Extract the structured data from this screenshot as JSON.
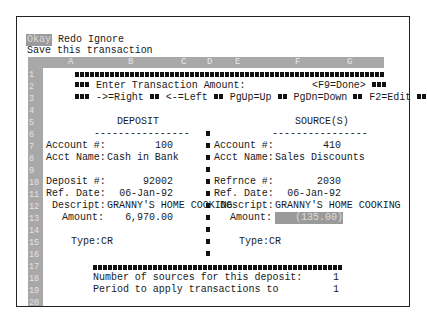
{
  "menu": {
    "items": [
      {
        "label": "Okay",
        "selected": true
      },
      {
        "label": "Redo",
        "selected": false
      },
      {
        "label": "Ignore",
        "selected": false
      }
    ],
    "status": "Save this transaction"
  },
  "grid": {
    "columns": [
      "A",
      "B",
      "C",
      "D",
      "E",
      "F",
      "G"
    ],
    "rows": [
      "1",
      "2",
      "3",
      "4",
      "5",
      "6",
      "7",
      "8",
      "9",
      "10",
      "11",
      "12",
      "13",
      "14",
      "15",
      "16",
      "17",
      "18",
      "19",
      "20"
    ]
  },
  "banner": {
    "prompt": "Enter Transaction Amount:",
    "done_key": "<F9=Done>",
    "keys": [
      "->=Right",
      "<-=Left",
      "PgUp=Up",
      "PgDn=Down",
      "F2=Edit"
    ]
  },
  "deposit": {
    "title": "DEPOSIT",
    "underline": "----------------",
    "account_label": "Account #:",
    "account_value": "100",
    "acct_name_label": "Acct Name:",
    "acct_name_value": "Cash in Bank",
    "deposit_label": "Deposit #:",
    "deposit_value": "92002",
    "ref_date_label": "Ref. Date:",
    "ref_date_value": "06-Jan-92",
    "descript_label": "Descript:",
    "descript_value": "GRANNY'S HOME COOKING",
    "amount_label": "Amount:",
    "amount_value": "6,970.00",
    "type_label": "Type:",
    "type_value": "CR"
  },
  "source": {
    "title": "SOURCE(S)",
    "underline": "----------------",
    "account_label": "Account #:",
    "account_value": "410",
    "acct_name_label": "Acct Name:",
    "acct_name_value": "Sales Discounts",
    "refrnce_label": "Refrnce #:",
    "refrnce_value": "2030",
    "ref_date_label": "Ref. Date:",
    "ref_date_value": "06-Jan-92",
    "descript_label": "Descript:",
    "descript_value": "GRANNY'S HOME COOKING",
    "amount_label": "Amount:",
    "amount_value": "(135.00)",
    "type_label": "Type:",
    "type_value": "CR"
  },
  "footer": {
    "sources_label": "Number of sources for this deposit:",
    "sources_value": "1",
    "period_label": "Period to apply transactions to",
    "period_value": "1"
  }
}
